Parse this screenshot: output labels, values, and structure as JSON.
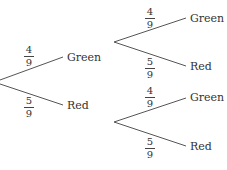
{
  "diagram": {
    "type": "probability-tree",
    "colors": {
      "line": "#555555",
      "text": "#333333"
    },
    "first_stage": {
      "branches": [
        {
          "outcome": "Green",
          "prob_num": "4",
          "prob_den": "9"
        },
        {
          "outcome": "Red",
          "prob_num": "5",
          "prob_den": "9"
        }
      ]
    },
    "second_stage": [
      {
        "branches": [
          {
            "outcome": "Green",
            "prob_num": "4",
            "prob_den": "9"
          },
          {
            "outcome": "Red",
            "prob_num": "5",
            "prob_den": "9"
          }
        ]
      },
      {
        "branches": [
          {
            "outcome": "Green",
            "prob_num": "4",
            "prob_den": "9"
          },
          {
            "outcome": "Red",
            "prob_num": "5",
            "prob_den": "9"
          }
        ]
      }
    ]
  }
}
